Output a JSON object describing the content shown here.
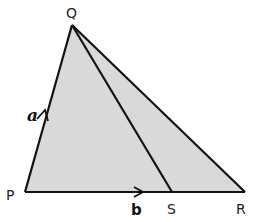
{
  "diagram": {
    "type": "triangle-vectors",
    "fill_color": "#d9d9d9",
    "stroke_color": "#111111",
    "points": {
      "P": {
        "label": "P",
        "x": 25,
        "y": 192
      },
      "Q": {
        "label": "Q",
        "x": 72,
        "y": 25
      },
      "R": {
        "label": "R",
        "x": 245,
        "y": 192
      },
      "S": {
        "label": "S",
        "x": 172,
        "y": 192
      }
    },
    "vectors": {
      "a": {
        "label": "a",
        "from": "P",
        "to": "Q"
      },
      "b": {
        "label": "b",
        "from": "P",
        "to": "R"
      }
    },
    "segments": [
      "PQ",
      "QR",
      "PR",
      "QS"
    ]
  }
}
